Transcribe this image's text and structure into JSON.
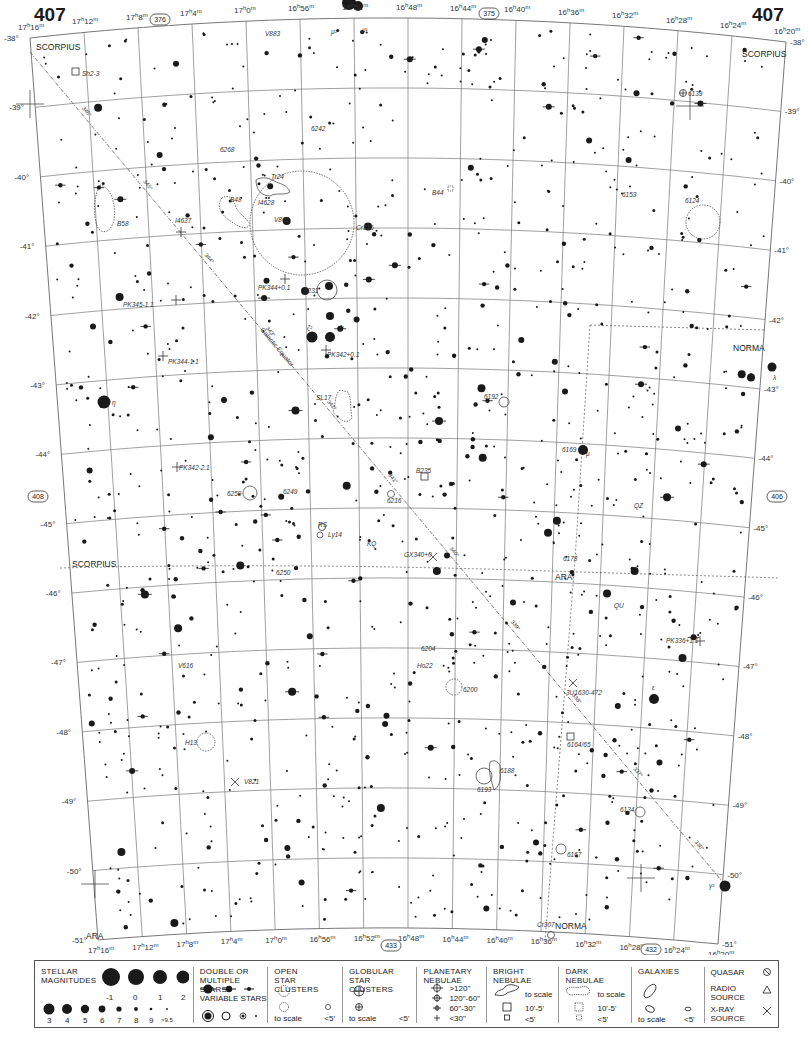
{
  "page": {
    "number_left": "407",
    "number_right": "407",
    "adjacent_chart_top": "376",
    "adjacent_chart_top2": "375",
    "adjacent_chart_left": "408",
    "adjacent_chart_right": "406",
    "adjacent_chart_bottom": "433",
    "adjacent_chart_bottom2": "432"
  },
  "top_ra_labels": [
    "17h16m",
    "17h12m",
    "17h8m",
    "17h4m",
    "17h0m",
    "16h56m",
    "16h52m",
    "16h48m",
    "16h44m",
    "16h40m",
    "16h36m",
    "16h32m",
    "16h28m",
    "16h24m",
    "16h20m"
  ],
  "bottom_ra_labels": [
    "17h16m",
    "17h12m",
    "17h8m",
    "17h4m",
    "17h0m",
    "16h56m",
    "16h52m",
    "16h48m",
    "16h44m",
    "16h40m",
    "16h36m",
    "16h32m",
    "16h28m",
    "16h24m",
    "16h20m"
  ],
  "dec_labels": [
    "-38°",
    "-39°",
    "-40°",
    "-41°",
    "-42°",
    "-43°",
    "-44°",
    "-45°",
    "-46°",
    "-47°",
    "-48°",
    "-49°",
    "-50°",
    "-51°"
  ],
  "constellations": [
    {
      "name": "SCORPIUS",
      "x": 36,
      "y": 50
    },
    {
      "name": "SCORPIUS",
      "x": 742,
      "y": 57
    },
    {
      "name": "NORMA",
      "x": 733,
      "y": 351
    },
    {
      "name": "SCORPIUS",
      "x": 72,
      "y": 567
    },
    {
      "name": "ARA",
      "x": 555,
      "y": 580
    },
    {
      "name": "ARA",
      "x": 86,
      "y": 939
    },
    {
      "name": "NORMA",
      "x": 555,
      "y": 929
    }
  ],
  "object_labels": [
    {
      "text": "Sh2-3",
      "x": 82,
      "y": 76
    },
    {
      "text": "V883",
      "x": 265,
      "y": 36
    },
    {
      "text": "μ²",
      "x": 331,
      "y": 34
    },
    {
      "text": "μ¹",
      "x": 362,
      "y": 32
    },
    {
      "text": "6139",
      "x": 688,
      "y": 96
    },
    {
      "text": "6242",
      "x": 311,
      "y": 131
    },
    {
      "text": "6268",
      "x": 220,
      "y": 152
    },
    {
      "text": "Tr24",
      "x": 271,
      "y": 179
    },
    {
      "text": "B48",
      "x": 230,
      "y": 202
    },
    {
      "text": "I4628",
      "x": 258,
      "y": 205
    },
    {
      "text": "B44",
      "x": 432,
      "y": 195
    },
    {
      "text": "6153",
      "x": 622,
      "y": 197
    },
    {
      "text": "6124",
      "x": 685,
      "y": 203
    },
    {
      "text": "B58",
      "x": 117,
      "y": 226
    },
    {
      "text": "I4637",
      "x": 175,
      "y": 223
    },
    {
      "text": "V861",
      "x": 274,
      "y": 222
    },
    {
      "text": "Cr316",
      "x": 356,
      "y": 230
    },
    {
      "text": "PK344+0.1",
      "x": 258,
      "y": 290
    },
    {
      "text": "6231",
      "x": 304,
      "y": 293
    },
    {
      "text": "PK345-1.1",
      "x": 123,
      "y": 307
    },
    {
      "text": "ζ²",
      "x": 307,
      "y": 330
    },
    {
      "text": "ζ¹",
      "x": 339,
      "y": 330
    },
    {
      "text": "PK342+0.1",
      "x": 327,
      "y": 357
    },
    {
      "text": "PK344-1.1",
      "x": 168,
      "y": 364
    },
    {
      "text": "λ",
      "x": 773,
      "y": 380
    },
    {
      "text": "η",
      "x": 112,
      "y": 405
    },
    {
      "text": "6192",
      "x": 484,
      "y": 399
    },
    {
      "text": "SL17",
      "x": 316,
      "y": 400
    },
    {
      "text": "6169",
      "x": 562,
      "y": 452
    },
    {
      "text": "μ",
      "x": 586,
      "y": 456
    },
    {
      "text": "B235",
      "x": 416,
      "y": 473
    },
    {
      "text": "PK342-2.1",
      "x": 179,
      "y": 470
    },
    {
      "text": "6259",
      "x": 227,
      "y": 496
    },
    {
      "text": "6249",
      "x": 283,
      "y": 494
    },
    {
      "text": "6216",
      "x": 387,
      "y": 503
    },
    {
      "text": "QZ",
      "x": 634,
      "y": 508
    },
    {
      "text": "RS",
      "x": 318,
      "y": 527
    },
    {
      "text": "Ly14",
      "x": 328,
      "y": 537
    },
    {
      "text": "KQ",
      "x": 367,
      "y": 546
    },
    {
      "text": "GX340+0",
      "x": 404,
      "y": 557
    },
    {
      "text": "6178",
      "x": 563,
      "y": 561
    },
    {
      "text": "6250",
      "x": 276,
      "y": 575
    },
    {
      "text": "QU",
      "x": 614,
      "y": 608
    },
    {
      "text": "PK336+1.1",
      "x": 666,
      "y": 643
    },
    {
      "text": "6204",
      "x": 421,
      "y": 651
    },
    {
      "text": "Hо22",
      "x": 417,
      "y": 668
    },
    {
      "text": "V616",
      "x": 178,
      "y": 668
    },
    {
      "text": "6200",
      "x": 463,
      "y": 692
    },
    {
      "text": "ε",
      "x": 652,
      "y": 690
    },
    {
      "text": "3U1630-472",
      "x": 566,
      "y": 695
    },
    {
      "text": "H13",
      "x": 185,
      "y": 745
    },
    {
      "text": "6164/65",
      "x": 567,
      "y": 747
    },
    {
      "text": "6188",
      "x": 500,
      "y": 773
    },
    {
      "text": "6193",
      "x": 477,
      "y": 792
    },
    {
      "text": "V821",
      "x": 244,
      "y": 784
    },
    {
      "text": "6134",
      "x": 620,
      "y": 812
    },
    {
      "text": "6167",
      "x": 567,
      "y": 857
    },
    {
      "text": "γ²",
      "x": 709,
      "y": 888
    },
    {
      "text": "Cr307",
      "x": 537,
      "y": 927
    }
  ],
  "galactic_equator": {
    "label": "Galactic Equator",
    "tick_labels": [
      "346°",
      "345°",
      "344°",
      "343°",
      "342°",
      "341°",
      "340°",
      "339°",
      "338°",
      "337°",
      "336°"
    ]
  },
  "legend": {
    "stellar_magnitudes": {
      "title": "STELLAR\nMAGNITUDES",
      "row1": [
        "-1",
        "0",
        "1",
        "2"
      ],
      "row2": [
        "3",
        "4",
        "5",
        "6",
        "7",
        "8",
        "9",
        ">9.5"
      ]
    },
    "double_stars": {
      "title": "DOUBLE OR\nMULTIPLE STARS"
    },
    "variable_stars": {
      "title": "VARIABLE STARS"
    },
    "open_clusters": {
      "title": "OPEN\nSTAR CLUSTERS",
      "to_scale": "to scale",
      "small": "<5'"
    },
    "globular_clusters": {
      "title": "GLOBULAR\nSTAR CLUSTERS",
      "to_scale": "to scale",
      "small": "<5'"
    },
    "planetary_nebulae": {
      "title": "PLANETARY\nNEBULAE",
      "sizes": [
        ">120\"",
        "120\"-60\"",
        "60\"-30\"",
        "<30\""
      ]
    },
    "bright_nebulae": {
      "title": "BRIGHT\nNEBULAE",
      "to_scale": "to scale",
      "mid": "10'-5'",
      "small": "<5'"
    },
    "dark_nebulae": {
      "title": "DARK\nNEBULAE",
      "to_scale": "to scale",
      "mid": "10'-5'",
      "small": "<5'"
    },
    "galaxies": {
      "title": "GALAXIES",
      "to_scale": "to scale",
      "small": "<5'"
    },
    "quasar": {
      "title": "QUASAR"
    },
    "radio_source": {
      "title": "RADIO\nSOURCE"
    },
    "xray_source": {
      "title": "X-RAY\nSOURCE"
    }
  },
  "colors": {
    "ink": "#1a1a1a",
    "grid": "#777777",
    "background": "#ffffff"
  }
}
